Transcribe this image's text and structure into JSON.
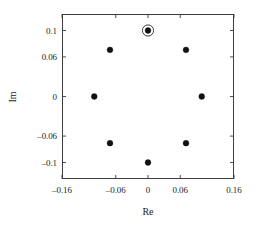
{
  "chart_data": {
    "type": "scatter",
    "title": "",
    "xlabel": "Re",
    "ylabel": "Im",
    "xlim": [
      -0.16,
      0.16
    ],
    "ylim": [
      -0.125,
      0.125
    ],
    "xticks": [
      -0.16,
      -0.06,
      0,
      0.06,
      0.16
    ],
    "xticklabels": [
      "–0.16",
      "–0.06",
      "0",
      "0.06",
      "0.16"
    ],
    "yticks": [
      0.1,
      0.06,
      0,
      -0.06,
      -0.1
    ],
    "yticklabels": [
      "0.1",
      "0.06",
      "0",
      "–0.06",
      "–0.1"
    ],
    "grid": false,
    "legend": null,
    "frame": "box",
    "tick_direction": "in",
    "marker": "filled-circle",
    "marker_color": "#111111",
    "series": [
      {
        "name": "constellation points",
        "radius": 0.1,
        "points": [
          {
            "x": 0.0,
            "y": 0.1,
            "angle_deg": 90,
            "highlighted": true
          },
          {
            "x": 0.0707,
            "y": 0.0707,
            "angle_deg": 45,
            "highlighted": false
          },
          {
            "x": 0.1,
            "y": 0.0,
            "angle_deg": 0,
            "highlighted": false
          },
          {
            "x": 0.0707,
            "y": -0.0707,
            "angle_deg": -45,
            "highlighted": false
          },
          {
            "x": 0.0,
            "y": -0.1,
            "angle_deg": -90,
            "highlighted": false
          },
          {
            "x": -0.0707,
            "y": -0.0707,
            "angle_deg": -135,
            "highlighted": false
          },
          {
            "x": -0.1,
            "y": 0.0,
            "angle_deg": 180,
            "highlighted": false
          },
          {
            "x": -0.0707,
            "y": 0.0707,
            "angle_deg": 135,
            "highlighted": false
          }
        ]
      }
    ],
    "annotations": [
      {
        "type": "ring",
        "target_x": 0.0,
        "target_y": 0.1,
        "description": "circle-highlight-around-point"
      }
    ]
  },
  "colors": {
    "axis": "#3d3d3d",
    "marker": "#111111",
    "text": "#1d1d1d",
    "background": "#ffffff"
  }
}
